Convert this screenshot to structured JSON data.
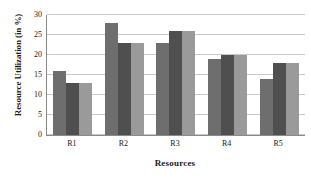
{
  "chart_data": {
    "type": "bar",
    "title": "",
    "xlabel": "Resources",
    "ylabel": "Resource Utilization (in %)",
    "categories": [
      "R1",
      "R2",
      "R3",
      "R4",
      "R5"
    ],
    "series": [
      {
        "name": "Series 1",
        "color": "#6e6e6e",
        "values": [
          16,
          28,
          23,
          19,
          14
        ]
      },
      {
        "name": "Series 2",
        "color": "#4f4f4f",
        "values": [
          13,
          23,
          26,
          20,
          18
        ]
      },
      {
        "name": "Series 3",
        "color": "#9a9a9a",
        "values": [
          13,
          23,
          26,
          20,
          18
        ]
      }
    ],
    "ylim": [
      0,
      30
    ],
    "yticks": [
      0,
      5,
      10,
      15,
      20,
      25,
      30
    ],
    "ytick_labels": [
      "0",
      "5",
      "10",
      "15",
      "20",
      "25",
      "30"
    ],
    "grid": true,
    "grid_axis": "y",
    "legend": false,
    "legend_position": "none",
    "background_color": "#ffffff",
    "axis_color": "#8a8a8a",
    "gridline_color": "#c9c9c9",
    "text_color": "#1a1a1a"
  }
}
